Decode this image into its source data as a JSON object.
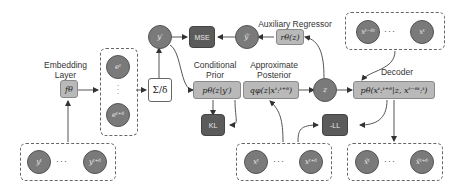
{
  "labels": {
    "embedding_layer": "Embedding Layer",
    "conditional_prior": "Conditional Prior",
    "approximate_posterior": "Approximate Posterior",
    "auxiliary_regressor": "Auxiliary Regressor",
    "decoder": "Decoder"
  },
  "nodes": {
    "f_theta": "fθ",
    "sum_delta": "Σ/δ",
    "y_prime": "y′",
    "y_hat_prime": "ŷ′",
    "mse": "MSE",
    "kl": "KL",
    "neg_ll": "-LL",
    "z": "z",
    "prior": "pθ(z|y′)",
    "posterior": "qφ(z|xᵗ:ᵗ⁺ᵟ)",
    "regressor": "rθ(z)",
    "decoder": "pθ(xᵗ:ᵗ⁺ᵟ|z, xᵗ⁻ᵟᵗ:ᵗ)"
  },
  "groups": {
    "embeddings": {
      "top": "eᵗ",
      "bottom": "eᵗ⁺ᵟ"
    },
    "y_inputs": {
      "first": "yᵗ",
      "last": "yᵗ⁺ᵟ",
      "ellipsis": "···"
    },
    "x_history": {
      "first": "xᵗ⁻ᵟᵗ",
      "last": "xᵗ",
      "ellipsis": "···"
    },
    "x_inputs": {
      "first": "xᵗ",
      "last": "xᵗ⁺ᵟ",
      "ellipsis": "···"
    },
    "x_outputs": {
      "first": "x̂ᵗ",
      "last": "x̂ᵗ⁺ᵟ",
      "ellipsis": "···"
    }
  }
}
